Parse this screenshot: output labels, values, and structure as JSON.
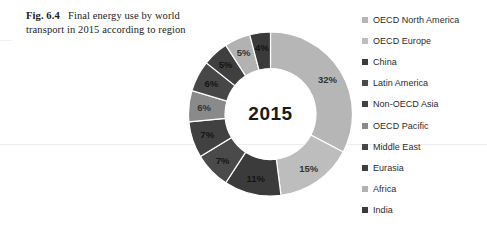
{
  "caption": {
    "figure_number": "Fig. 6.4",
    "text": "Final energy use by world transport in 2015 according to region"
  },
  "chart_data": {
    "type": "pie",
    "variant": "donut",
    "title": "Final energy use by world transport in 2015 according to region",
    "center_label": "2015",
    "unit": "%",
    "legend_position": "right",
    "grid": false,
    "categories": [
      "OECD North America",
      "OECD Europe",
      "China",
      "Latin America",
      "Non-OECD Asia",
      "OECD Pacific",
      "Middle East",
      "Eurasia",
      "Africa",
      "India"
    ],
    "values": [
      32,
      15,
      11,
      7,
      7,
      6,
      6,
      5,
      5,
      4
    ],
    "data_labels": [
      "32%",
      "15%",
      "11%",
      "7%",
      "7%",
      "6%",
      "6%",
      "5%",
      "5%",
      "4%"
    ],
    "colors": [
      "#b6b6b6",
      "#bdbdbd",
      "#3b3b3b",
      "#4a4a4a",
      "#414141",
      "#8a8a8a",
      "#474747",
      "#3f3f3f",
      "#b2b2b2",
      "#3a3a3a"
    ],
    "label_text_colors": [
      "dark-on-light",
      "dark-on-light",
      "dark-on-dark",
      "dark-on-dark",
      "dark-on-dark",
      "dark-on-light",
      "dark-on-dark",
      "dark-on-dark",
      "dark-on-light",
      "dark-on-dark"
    ]
  },
  "legend": {
    "items": [
      {
        "label": "OECD North America",
        "color": "#b6b6b6"
      },
      {
        "label": "OECD Europe",
        "color": "#bdbdbd"
      },
      {
        "label": "China",
        "color": "#3b3b3b"
      },
      {
        "label": "Latin America",
        "color": "#4a4a4a"
      },
      {
        "label": "Non-OECD Asia",
        "color": "#414141"
      },
      {
        "label": "OECD Pacific",
        "color": "#8a8a8a"
      },
      {
        "label": "Middle East",
        "color": "#474747"
      },
      {
        "label": "Eurasia",
        "color": "#3f3f3f"
      },
      {
        "label": "Africa",
        "color": "#b2b2b2"
      },
      {
        "label": "India",
        "color": "#3a3a3a"
      }
    ]
  }
}
